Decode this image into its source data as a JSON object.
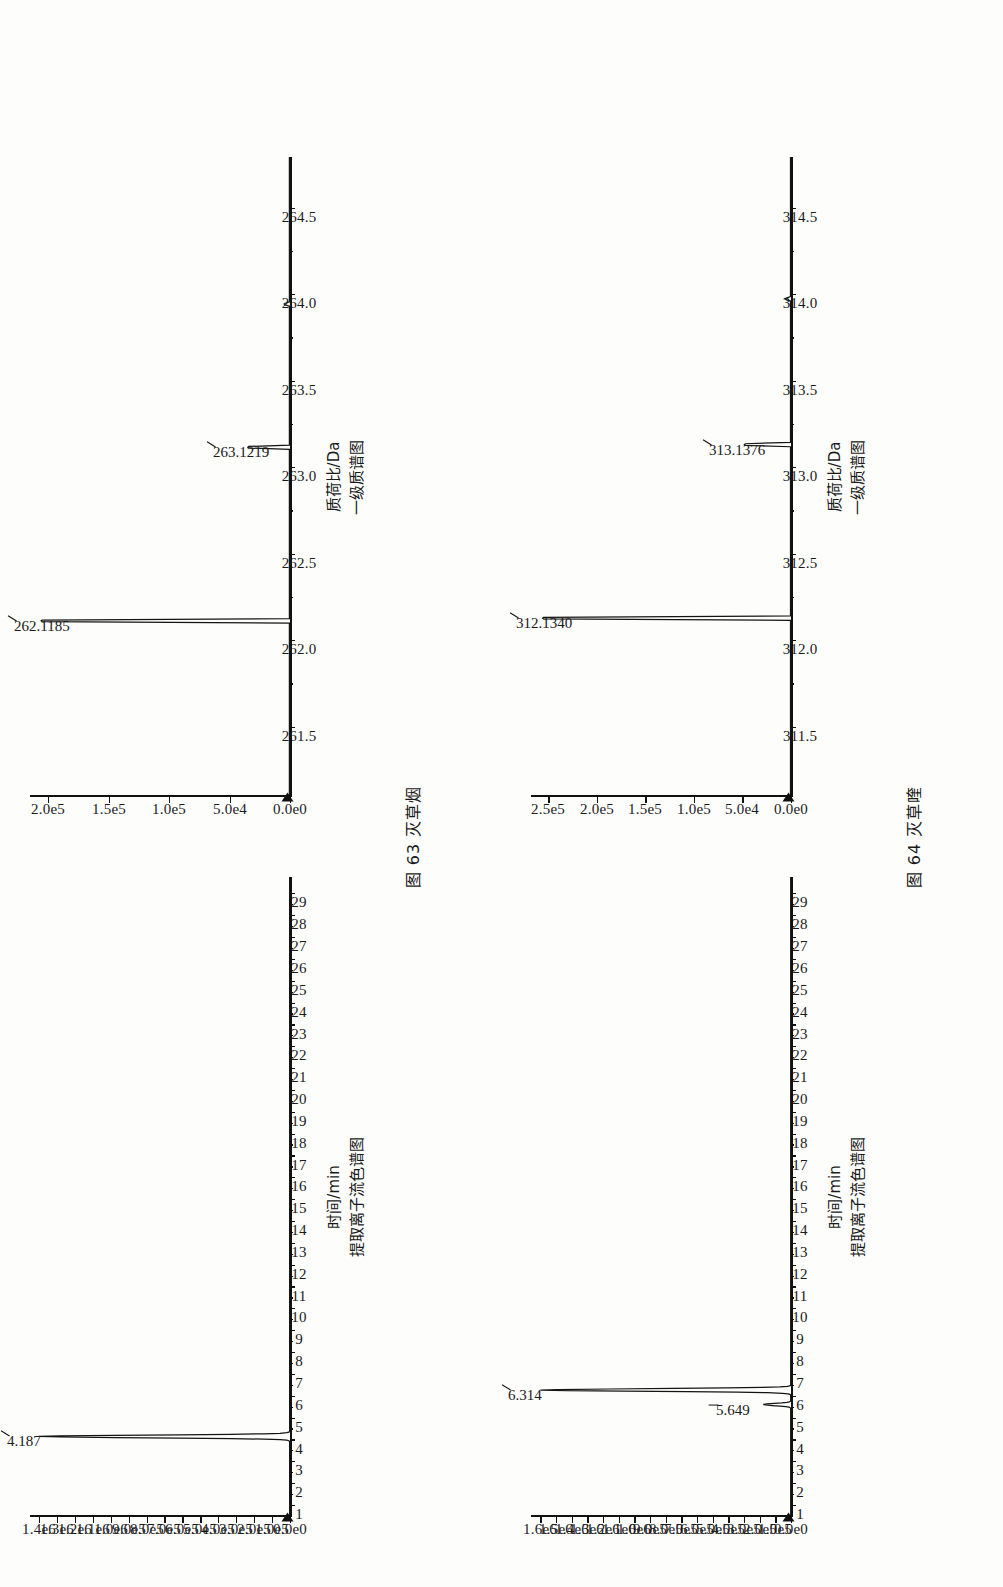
{
  "page": {
    "background_color": "#fdfdfc",
    "ink_color": "#141414",
    "width": 1003,
    "height": 1587
  },
  "figures": [
    {
      "id": "fig63",
      "caption_number": "图 63",
      "caption_name": "灭草烟",
      "caption_full": "图 63  灭草烟",
      "panels": [
        {
          "id": "xic63",
          "role": "extracted-ion-chromatogram",
          "title_cn": "提取离子流色谱图",
          "xlabel": "时间/min",
          "x_ticks": [
            "1",
            "2",
            "3",
            "4",
            "5",
            "6",
            "7",
            "8",
            "9",
            "10",
            "11",
            "12",
            "13",
            "14",
            "15",
            "16",
            "17",
            "18",
            "19",
            "20",
            "21",
            "22",
            "23",
            "24",
            "25",
            "26",
            "27",
            "28",
            "29"
          ],
          "y_ticks": [
            "0.0e0",
            "1.0e5",
            "2.0e5",
            "3.0e5",
            "4.0e5",
            "5.0e5",
            "6.0e5",
            "7.0e5",
            "8.0e5",
            "9.0e5",
            "1.0e6",
            "1.1e6",
            "1.2e6",
            "1.3e6",
            "1.4e6"
          ],
          "peak_labels": [
            "4.187"
          ]
        },
        {
          "id": "ms63",
          "role": "ms1-spectrum",
          "title_cn": "一级质谱图",
          "xlabel": "质荷比/Da",
          "x_ticks": [
            "261.5",
            "262.0",
            "262.5",
            "263.0",
            "263.5",
            "264.0",
            "264.5"
          ],
          "y_ticks": [
            "0.0e0",
            "5.0e4",
            "1.0e5",
            "1.5e5",
            "2.0e5"
          ],
          "peak_labels": [
            "262.1185",
            "263.1219"
          ]
        }
      ]
    },
    {
      "id": "fig64",
      "caption_number": "图 64",
      "caption_name": "灭草喹",
      "caption_full": "图 64  灭草喹",
      "panels": [
        {
          "id": "xic64",
          "role": "extracted-ion-chromatogram",
          "title_cn": "提取离子流色谱图",
          "xlabel": "时间/min",
          "x_ticks": [
            "1",
            "2",
            "3",
            "4",
            "5",
            "6",
            "7",
            "8",
            "9",
            "10",
            "11",
            "12",
            "13",
            "14",
            "15",
            "16",
            "17",
            "18",
            "19",
            "20",
            "21",
            "22",
            "23",
            "24",
            "25",
            "26",
            "27",
            "28",
            "29"
          ],
          "y_ticks": [
            "0.0e0",
            "1.0e5",
            "2.0e5",
            "3.0e5",
            "4.0e5",
            "5.0e5",
            "6.0e5",
            "7.0e5",
            "8.0e5",
            "9.0e5",
            "1.0e6",
            "1.1e6",
            "1.2e6",
            "1.3e6",
            "1.4e6",
            "1.5e6",
            "1.6e6"
          ],
          "peak_labels": [
            "6.314",
            "5.649"
          ]
        },
        {
          "id": "ms64",
          "role": "ms1-spectrum",
          "title_cn": "一级质谱图",
          "xlabel": "质荷比/Da",
          "x_ticks": [
            "311.5",
            "312.0",
            "312.5",
            "313.0",
            "313.5",
            "314.0",
            "314.5"
          ],
          "y_ticks": [
            "0.0e0",
            "5.0e4",
            "1.0e5",
            "1.5e5",
            "2.0e5",
            "2.5e5"
          ],
          "peak_labels": [
            "312.1340",
            "313.1376"
          ]
        }
      ]
    }
  ],
  "chart_data": [
    {
      "id": "xic63",
      "type": "line",
      "title": "提取离子流色谱图",
      "xlabel": "时间/min",
      "ylabel": "",
      "xlim": [
        0.5,
        29.8
      ],
      "ylim": [
        0,
        1450000
      ],
      "x_tick_values": [
        1,
        2,
        3,
        4,
        5,
        6,
        7,
        8,
        9,
        10,
        11,
        12,
        13,
        14,
        15,
        16,
        17,
        18,
        19,
        20,
        21,
        22,
        23,
        24,
        25,
        26,
        27,
        28,
        29
      ],
      "x_tick_labels": [
        "1",
        "2",
        "3",
        "4",
        "5",
        "6",
        "7",
        "8",
        "9",
        "10",
        "11",
        "12",
        "13",
        "14",
        "15",
        "16",
        "17",
        "18",
        "19",
        "20",
        "21",
        "22",
        "23",
        "24",
        "25",
        "26",
        "27",
        "28",
        "29"
      ],
      "y_tick_values": [
        0,
        100000,
        200000,
        300000,
        400000,
        500000,
        600000,
        700000,
        800000,
        900000,
        1000000,
        1100000,
        1200000,
        1300000,
        1400000
      ],
      "y_tick_labels": [
        "0.0e0",
        "1.0e5",
        "2.0e5",
        "3.0e5",
        "4.0e5",
        "5.0e5",
        "6.0e5",
        "7.0e5",
        "8.0e5",
        "9.0e5",
        "1.0e6",
        "1.1e6",
        "1.2e6",
        "1.3e6",
        "1.4e6"
      ],
      "grid": false,
      "legend": "none",
      "annotations": [
        {
          "label": "4.187",
          "x": 4.187,
          "y": 1400000
        }
      ],
      "peaks": [
        {
          "retention_time": 4.187,
          "intensity": 1400000,
          "width": 0.18
        }
      ],
      "baseline": 2000
    },
    {
      "id": "ms63",
      "type": "line",
      "title": "一级质谱图",
      "xlabel": "质荷比/Da",
      "ylabel": "",
      "xlim": [
        261.1,
        264.8
      ],
      "ylim": [
        0,
        215000
      ],
      "x_tick_values": [
        261.5,
        262.0,
        262.5,
        263.0,
        263.5,
        264.0,
        264.5
      ],
      "x_tick_labels": [
        "261.5",
        "262.0",
        "262.5",
        "263.0",
        "263.5",
        "264.0",
        "264.5"
      ],
      "y_tick_values": [
        0,
        50000,
        100000,
        150000,
        200000
      ],
      "y_tick_labels": [
        "0.0e0",
        "5.0e4",
        "1.0e5",
        "1.5e5",
        "2.0e5"
      ],
      "grid": false,
      "legend": "none",
      "annotations": [
        {
          "label": "262.1185",
          "x": 262.1185,
          "y": 205000
        },
        {
          "label": "263.1219",
          "x": 263.1219,
          "y": 34000
        }
      ],
      "peaks": [
        {
          "mz": 262.1185,
          "intensity": 205000
        },
        {
          "mz": 263.1219,
          "intensity": 34000
        },
        {
          "mz": 263.95,
          "intensity": 4000
        }
      ],
      "baseline": 500
    },
    {
      "id": "xic64",
      "type": "line",
      "title": "提取离子流色谱图",
      "xlabel": "时间/min",
      "ylabel": "",
      "xlim": [
        0.5,
        29.8
      ],
      "ylim": [
        0,
        1660000
      ],
      "x_tick_values": [
        1,
        2,
        3,
        4,
        5,
        6,
        7,
        8,
        9,
        10,
        11,
        12,
        13,
        14,
        15,
        16,
        17,
        18,
        19,
        20,
        21,
        22,
        23,
        24,
        25,
        26,
        27,
        28,
        29
      ],
      "x_tick_labels": [
        "1",
        "2",
        "3",
        "4",
        "5",
        "6",
        "7",
        "8",
        "9",
        "10",
        "11",
        "12",
        "13",
        "14",
        "15",
        "16",
        "17",
        "18",
        "19",
        "20",
        "21",
        "22",
        "23",
        "24",
        "25",
        "26",
        "27",
        "28",
        "29"
      ],
      "y_tick_values": [
        0,
        100000,
        200000,
        300000,
        400000,
        500000,
        600000,
        700000,
        800000,
        900000,
        1000000,
        1100000,
        1200000,
        1300000,
        1400000,
        1500000,
        1600000
      ],
      "y_tick_labels": [
        "0.0e0",
        "1.0e5",
        "2.0e5",
        "3.0e5",
        "4.0e5",
        "5.0e5",
        "6.0e5",
        "7.0e5",
        "8.0e5",
        "9.0e5",
        "1.0e6",
        "1.1e6",
        "1.2e6",
        "1.3e6",
        "1.4e6",
        "1.5e6",
        "1.6e6"
      ],
      "grid": false,
      "legend": "none",
      "annotations": [
        {
          "label": "6.314",
          "x": 6.314,
          "y": 1600000
        },
        {
          "label": "5.649",
          "x": 5.649,
          "y": 175000
        }
      ],
      "peaks": [
        {
          "retention_time": 5.649,
          "intensity": 175000,
          "width": 0.16
        },
        {
          "retention_time": 6.314,
          "intensity": 1600000,
          "width": 0.18
        }
      ],
      "baseline": 2000
    },
    {
      "id": "ms64",
      "type": "line",
      "title": "一级质谱图",
      "xlabel": "质荷比/Da",
      "ylabel": "",
      "xlim": [
        311.1,
        314.8
      ],
      "ylim": [
        0,
        268000
      ],
      "x_tick_values": [
        311.5,
        312.0,
        312.5,
        313.0,
        313.5,
        314.0,
        314.5
      ],
      "x_tick_labels": [
        "311.5",
        "312.0",
        "312.5",
        "313.0",
        "313.5",
        "314.0",
        "314.5"
      ],
      "y_tick_values": [
        0,
        50000,
        100000,
        150000,
        200000,
        250000
      ],
      "y_tick_labels": [
        "0.0e0",
        "5.0e4",
        "1.0e5",
        "1.5e5",
        "2.0e5",
        "2.5e5"
      ],
      "grid": false,
      "legend": "none",
      "annotations": [
        {
          "label": "312.1340",
          "x": 312.134,
          "y": 255000
        },
        {
          "label": "313.1376",
          "x": 313.1376,
          "y": 47000
        }
      ],
      "peaks": [
        {
          "mz": 312.134,
          "intensity": 255000
        },
        {
          "mz": 313.1376,
          "intensity": 47000
        },
        {
          "mz": 313.98,
          "intensity": 5000
        }
      ],
      "baseline": 500
    }
  ]
}
